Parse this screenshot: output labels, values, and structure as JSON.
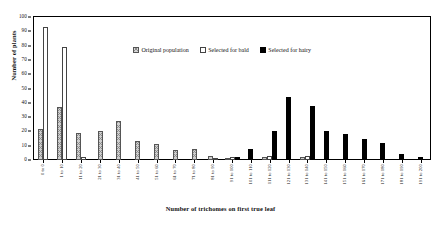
{
  "chart_data": {
    "type": "bar",
    "title": "",
    "xlabel": "Number of trichomes on first true leaf",
    "ylabel": "Number of plants",
    "ylim": [
      0,
      100
    ],
    "yticks": [
      0,
      10,
      20,
      30,
      40,
      50,
      60,
      70,
      80,
      90,
      100
    ],
    "grid": false,
    "legend_position": "top-center",
    "categories": [
      "0 to 0",
      "1 to 10",
      "11 to 20",
      "21 to 30",
      "31 to 40",
      "41 to 50",
      "51 to 60",
      "61 to 70",
      "71 to 80",
      "81 to 90",
      "91 to 100",
      "101 to 110",
      "111 to 120",
      "121 to 130",
      "131 to 140",
      "141 to 150",
      "151 to 160",
      "161 to 170",
      "171 to 180",
      "181 to 190",
      "191 to 200"
    ],
    "series": [
      {
        "name": "Original population",
        "key": "orig",
        "values": [
          22,
          37,
          19,
          20,
          27,
          13,
          11,
          7,
          8,
          3,
          1,
          0,
          2,
          0,
          2,
          0,
          0,
          0,
          0,
          0,
          0
        ]
      },
      {
        "name": "Selected for bald",
        "key": "bald",
        "values": [
          93,
          79,
          2,
          0,
          0,
          0,
          0,
          0,
          0,
          1,
          2,
          0,
          3,
          0,
          3,
          0,
          0,
          0,
          0,
          0,
          0
        ]
      },
      {
        "name": "Selected for hairy",
        "key": "hairy",
        "values": [
          0,
          0,
          0,
          0,
          0,
          0,
          0,
          0,
          0,
          0,
          2,
          8,
          20,
          44,
          38,
          20,
          18,
          15,
          12,
          4,
          2
        ]
      }
    ]
  },
  "legend": {
    "items": [
      {
        "label": "Original population",
        "key": "orig"
      },
      {
        "label": "Selected for bald",
        "key": "bald"
      },
      {
        "label": "Selected for hairy",
        "key": "hairy"
      }
    ]
  }
}
